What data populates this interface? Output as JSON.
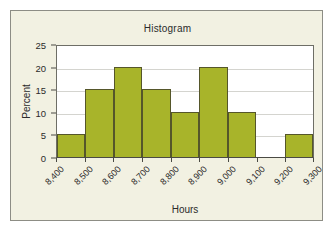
{
  "chart_data": {
    "type": "bar",
    "title": "Histogram",
    "xlabel": "Hours",
    "ylabel": "Percent",
    "categories": [
      "8,400",
      "8,500",
      "8,600",
      "8,700",
      "8,800",
      "8,900",
      "9,000",
      "9,100",
      "9,200"
    ],
    "bin_edges": [
      "8,400",
      "8,500",
      "8,600",
      "8,700",
      "8,800",
      "8,900",
      "9,000",
      "9,100",
      "9,200",
      "9,300"
    ],
    "values": [
      5,
      15,
      20,
      15,
      10,
      20,
      10,
      0,
      5
    ],
    "xtick_labels": [
      "8,400",
      "8,500",
      "8,600",
      "8,700",
      "8,800",
      "8,900",
      "9,000",
      "9,100",
      "9,200",
      "9,300"
    ],
    "ytick_labels": [
      "0",
      "5",
      "10",
      "15",
      "20",
      "25"
    ],
    "ytick_values": [
      0,
      5,
      10,
      15,
      20,
      25
    ],
    "ylim": [
      0,
      25
    ],
    "xlim": [
      "8,400",
      "9,300"
    ],
    "grid": true,
    "legend": false,
    "bar_color": "#a8b42a",
    "bar_edge_color": "#55562a",
    "plot_background": "#ffffff",
    "panel_background": "#f2f1e2",
    "gridline_color": "#d4d4cf",
    "axis_color": "#4a4a44",
    "text_color": "#2b2b2b"
  }
}
